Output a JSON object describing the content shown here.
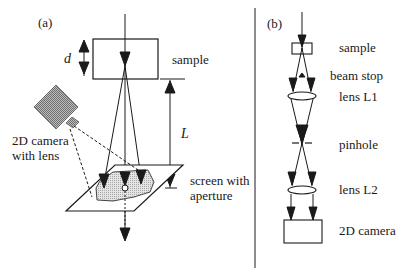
{
  "panel_a": {
    "label": "(a)",
    "sample_label": "sample",
    "thickness_label": "d",
    "distance_label": "L",
    "camera_label_line1": "2D camera",
    "camera_label_line2": "with lens",
    "screen_label_line1": "screen with",
    "screen_label_line2": "aperture"
  },
  "panel_b": {
    "label": "(b)",
    "components": [
      {
        "label": "sample"
      },
      {
        "label": "beam stop"
      },
      {
        "label": "lens L1"
      },
      {
        "label": "pinhole"
      },
      {
        "label": "lens L2"
      },
      {
        "label": "2D camera"
      }
    ]
  },
  "colors": {
    "line": "#1a1a1a",
    "hatch": "#8a8a8a",
    "screen_fill": "#d6d6d6"
  }
}
